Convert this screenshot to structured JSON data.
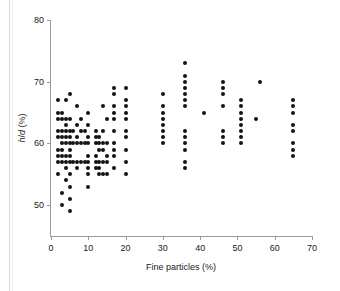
{
  "figure": {
    "background_color": "#ffffff",
    "point_color": "#141414",
    "axis_color": "#9a9a9a"
  },
  "axes": {
    "x_label": "Fine particles (%)",
    "y_label_prefix": "h",
    "y_label_slash": "/",
    "y_label_italic": "d",
    "y_label_suffix": " (%)",
    "y_label_full": "h/d (%)",
    "x_ticks": [
      "0",
      "10",
      "20",
      "30",
      "40",
      "50",
      "60",
      "70"
    ],
    "y_ticks": [
      "50",
      "60",
      "70",
      "80"
    ]
  },
  "chart_data": {
    "type": "scatter",
    "title": "",
    "xlabel": "Fine particles (%)",
    "ylabel": "h/d (%)",
    "xlim": [
      0,
      70
    ],
    "ylim": [
      45,
      80
    ],
    "grid": false,
    "legend": null,
    "x_ticks": [
      0,
      10,
      20,
      30,
      40,
      50,
      60,
      70
    ],
    "y_ticks": [
      50,
      60,
      70,
      80
    ],
    "point_marker": "filled-circle",
    "points": [
      [
        2,
        67
      ],
      [
        2,
        65
      ],
      [
        2,
        64
      ],
      [
        2,
        62
      ],
      [
        2,
        61
      ],
      [
        2,
        59
      ],
      [
        2,
        58
      ],
      [
        2,
        57
      ],
      [
        2,
        55
      ],
      [
        3,
        65
      ],
      [
        3,
        64
      ],
      [
        3,
        62
      ],
      [
        3,
        61
      ],
      [
        3,
        60
      ],
      [
        3,
        59
      ],
      [
        3,
        58
      ],
      [
        3,
        57
      ],
      [
        3,
        52
      ],
      [
        3,
        50
      ],
      [
        4,
        67
      ],
      [
        4,
        64
      ],
      [
        4,
        63
      ],
      [
        4,
        62
      ],
      [
        4,
        61
      ],
      [
        4,
        60
      ],
      [
        4,
        58
      ],
      [
        4,
        57
      ],
      [
        4,
        56
      ],
      [
        4,
        54
      ],
      [
        5,
        68
      ],
      [
        5,
        64
      ],
      [
        5,
        62
      ],
      [
        5,
        61
      ],
      [
        5,
        60
      ],
      [
        5,
        59
      ],
      [
        5,
        58
      ],
      [
        5,
        57
      ],
      [
        5,
        55
      ],
      [
        5,
        53
      ],
      [
        5,
        51
      ],
      [
        5,
        49
      ],
      [
        6,
        62
      ],
      [
        6,
        60
      ],
      [
        6,
        57
      ],
      [
        7,
        66
      ],
      [
        7,
        63
      ],
      [
        7,
        61
      ],
      [
        7,
        60
      ],
      [
        7,
        57
      ],
      [
        7,
        56
      ],
      [
        8,
        64
      ],
      [
        8,
        62
      ],
      [
        8,
        60
      ],
      [
        8,
        57
      ],
      [
        9,
        62
      ],
      [
        9,
        60
      ],
      [
        9,
        57
      ],
      [
        10,
        65
      ],
      [
        10,
        63
      ],
      [
        10,
        61
      ],
      [
        10,
        60
      ],
      [
        10,
        58
      ],
      [
        10,
        57
      ],
      [
        10,
        56
      ],
      [
        10,
        55
      ],
      [
        10,
        53
      ],
      [
        12,
        62
      ],
      [
        12,
        61
      ],
      [
        12,
        60
      ],
      [
        12,
        58
      ],
      [
        12,
        57
      ],
      [
        12,
        56
      ],
      [
        13,
        61
      ],
      [
        13,
        60
      ],
      [
        13,
        59
      ],
      [
        13,
        57
      ],
      [
        13,
        56
      ],
      [
        13,
        55
      ],
      [
        14,
        66
      ],
      [
        14,
        62
      ],
      [
        14,
        60
      ],
      [
        14,
        59
      ],
      [
        14,
        57
      ],
      [
        14,
        55
      ],
      [
        15,
        64
      ],
      [
        15,
        60
      ],
      [
        15,
        58
      ],
      [
        15,
        57
      ],
      [
        15,
        55
      ],
      [
        17,
        69
      ],
      [
        17,
        68
      ],
      [
        17,
        66
      ],
      [
        17,
        65
      ],
      [
        17,
        64
      ],
      [
        17,
        62
      ],
      [
        17,
        60
      ],
      [
        17,
        59
      ],
      [
        17,
        58
      ],
      [
        17,
        56
      ],
      [
        20,
        69
      ],
      [
        20,
        67
      ],
      [
        20,
        66
      ],
      [
        20,
        65
      ],
      [
        20,
        64
      ],
      [
        20,
        62
      ],
      [
        20,
        61
      ],
      [
        20,
        59
      ],
      [
        20,
        57
      ],
      [
        20,
        55
      ],
      [
        30,
        68
      ],
      [
        30,
        66
      ],
      [
        30,
        65
      ],
      [
        30,
        64
      ],
      [
        30,
        63
      ],
      [
        30,
        62
      ],
      [
        30,
        61
      ],
      [
        30,
        60
      ],
      [
        36,
        73
      ],
      [
        36,
        71
      ],
      [
        36,
        70
      ],
      [
        36,
        69
      ],
      [
        36,
        68
      ],
      [
        36,
        67
      ],
      [
        36,
        66
      ],
      [
        36,
        62
      ],
      [
        36,
        61
      ],
      [
        36,
        60
      ],
      [
        36,
        59
      ],
      [
        36,
        57
      ],
      [
        36,
        56
      ],
      [
        41,
        65
      ],
      [
        46,
        70
      ],
      [
        46,
        69
      ],
      [
        46,
        68
      ],
      [
        46,
        66
      ],
      [
        46,
        62
      ],
      [
        46,
        61
      ],
      [
        46,
        60
      ],
      [
        51,
        67
      ],
      [
        51,
        66
      ],
      [
        51,
        65
      ],
      [
        51,
        64
      ],
      [
        51,
        63
      ],
      [
        51,
        62
      ],
      [
        51,
        61
      ],
      [
        51,
        60
      ],
      [
        55,
        64
      ],
      [
        56,
        70
      ],
      [
        65,
        67
      ],
      [
        65,
        66
      ],
      [
        65,
        65
      ],
      [
        65,
        63
      ],
      [
        65,
        62
      ],
      [
        65,
        60
      ],
      [
        65,
        59
      ],
      [
        65,
        58
      ]
    ]
  },
  "caption": {
    "text": ""
  }
}
